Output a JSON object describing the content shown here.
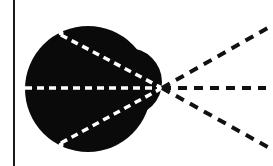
{
  "diagram": {
    "background": "#ffffff",
    "frame_line": {
      "x": 14,
      "y1": 0,
      "y2": 166,
      "color": "#1a1a1a",
      "width": 2
    },
    "blob": {
      "color": "#0a0a0a",
      "main_circle": {
        "cx": 88,
        "cy": 89,
        "r": 63
      },
      "right_bump": {
        "cx": 128,
        "cy": 82,
        "r": 34
      },
      "notches": [
        {
          "x": 61,
          "y": 33
        },
        {
          "x": 61,
          "y": 145
        }
      ]
    },
    "vertex": {
      "x": 162,
      "y": 88
    },
    "inner_rays": {
      "color": "#ffffff",
      "dash": "7 5",
      "width": 3.5,
      "lines": [
        {
          "x1": 25,
          "y1": 88,
          "x2": 162,
          "y2": 88
        },
        {
          "x1": 61,
          "y1": 35,
          "x2": 162,
          "y2": 88
        },
        {
          "x1": 61,
          "y1": 143,
          "x2": 162,
          "y2": 88
        }
      ]
    },
    "outer_rays": {
      "color": "#111111",
      "dash": "9 7",
      "width": 4,
      "lines": [
        {
          "x1": 162,
          "y1": 88,
          "x2": 273,
          "y2": 25
        },
        {
          "x1": 162,
          "y1": 88,
          "x2": 266,
          "y2": 88
        },
        {
          "x1": 162,
          "y1": 88,
          "x2": 273,
          "y2": 150
        }
      ]
    }
  }
}
